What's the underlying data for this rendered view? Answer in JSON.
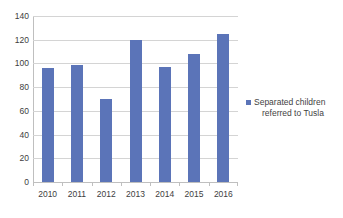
{
  "chart_data": {
    "type": "bar",
    "title": "",
    "subtitle": "",
    "xlabel": "",
    "ylabel": "",
    "categories": [
      "2010",
      "2011",
      "2012",
      "2013",
      "2014",
      "2015",
      "2016"
    ],
    "series": [
      {
        "name": "Separated children referred to Tusla",
        "values": [
          96,
          99,
          70,
          120,
          97,
          108,
          125
        ],
        "color": "#5b74b8"
      }
    ],
    "ylim": [
      0,
      140
    ],
    "y_ticks": [
      0,
      20,
      40,
      60,
      80,
      100,
      120,
      140
    ],
    "y_tick_labels": [
      "0",
      "20",
      "40",
      "60",
      "80",
      "100",
      "120",
      "140"
    ],
    "grid": "horizontal",
    "legend_position": "right"
  },
  "legend": {
    "line_1": "Separated children",
    "line_2": "referred to Tusla",
    "swatch_color": "#5b74b8"
  },
  "axes": {
    "gridline_color": "#d4d4d4",
    "axis_line_color": "#bfbfbf",
    "tick_label_color": "#404040"
  }
}
